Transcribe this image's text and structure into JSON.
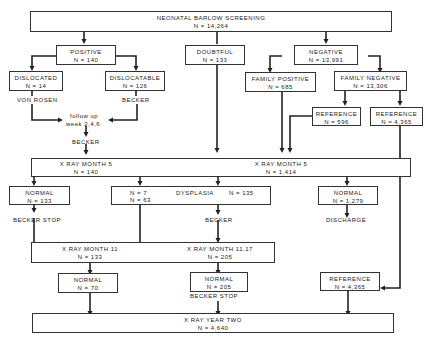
{
  "screening": {
    "title": "NEONATAL BARLOW SCREENING",
    "n": "N = 14,264"
  },
  "positive": {
    "title": "POSITIVE",
    "n": "N = 140"
  },
  "doubtful": {
    "title": "DOUBTFUL",
    "n": "N = 133"
  },
  "negative": {
    "title": "NEGATIVE",
    "n": "N = 13,991"
  },
  "dislocated": {
    "title": "DISLOCATED",
    "n": "N = 14"
  },
  "dislocatable": {
    "title": "DISLOCATABLE",
    "n": "N = 126"
  },
  "family_positive": {
    "title": "FAMILY POSITIVE",
    "n": "N = 685"
  },
  "family_negative": {
    "title": "FAMILY NEGATIVE",
    "n": "N = 13,306"
  },
  "reference_596": {
    "title": "REFERENCE",
    "n": "N = 596"
  },
  "reference_4365a": {
    "title": "REFERENCE",
    "n": "N = 4,365"
  },
  "labels": {
    "von_rosen": "VON ROSEN",
    "becker1": "BECKER",
    "follow_up1": "follow up",
    "follow_up2": "week 2,4,6",
    "becker2": "BECKER",
    "becker_stop1": "BECKER STOP",
    "becker3": "BECKER",
    "discharge": "DISCHARGE",
    "becker_stop2": "BECKER STOP"
  },
  "xray5_left": {
    "title": "X RAY MONTH 5",
    "n": "N = 140"
  },
  "xray5_right": {
    "title": "X RAY MONTH 5",
    "n": "N = 1,414"
  },
  "normal_133": {
    "title": "NORMAL",
    "n": "N = 133"
  },
  "dysplasia": {
    "title": "DYSPLASIA",
    "n_left1": "N = 7",
    "n_left2": "N = 63",
    "n_right": "N = 135"
  },
  "normal_1279": {
    "title": "NORMAL",
    "n": "N = 1,279"
  },
  "xray11": {
    "title": "X RAY MONTH 11",
    "n": "N = 133"
  },
  "xray11_17": {
    "title": "X RAY MONTH 11,17",
    "n": "N = 205"
  },
  "normal_70": {
    "title": "NORMAL",
    "n": "N = 70"
  },
  "normal_205": {
    "title": "NORMAL",
    "n": "N = 205"
  },
  "reference_4365b": {
    "title": "REFERENCE",
    "n": "N = 4,365"
  },
  "xray_year2": {
    "title": "X RAY YEAR TWO",
    "n": "N = 4,640"
  }
}
